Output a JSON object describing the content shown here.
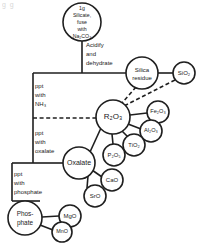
{
  "diagram": {
    "type": "flowchart",
    "artifact_text": "g  g",
    "colors": {
      "stroke": "#1f1f1f",
      "fill": "#ffffff",
      "background": "#ffffff"
    },
    "nodes": [
      {
        "id": "sample",
        "label_lines": [
          "1g",
          "Silicate,",
          "fuse",
          "with",
          "Na₂CO₃"
        ],
        "cx": 82,
        "cy": 22,
        "r": 19
      },
      {
        "id": "silica",
        "label_lines": [
          "Silica",
          "residue"
        ],
        "cx": 142,
        "cy": 73,
        "r": 16
      },
      {
        "id": "sio2",
        "label_lines": [
          "SiO₂"
        ],
        "cx": 184,
        "cy": 73,
        "r": 11
      },
      {
        "id": "r2o3",
        "label_lines": [
          "R₂O₃"
        ],
        "cx": 113,
        "cy": 117,
        "r": 17
      },
      {
        "id": "fe2o3",
        "label_lines": [
          "Fe₂O₃"
        ],
        "cx": 158,
        "cy": 112,
        "r": 11
      },
      {
        "id": "al2o3",
        "label_lines": [
          "Al₂O₃"
        ],
        "cx": 151,
        "cy": 131,
        "r": 11
      },
      {
        "id": "tio2",
        "label_lines": [
          "TiO₂"
        ],
        "cx": 134,
        "cy": 145,
        "r": 11
      },
      {
        "id": "p2o5",
        "label_lines": [
          "P₂O₅"
        ],
        "cx": 114,
        "cy": 155,
        "r": 11
      },
      {
        "id": "oxalate",
        "label_lines": [
          "Oxalate"
        ],
        "cx": 79,
        "cy": 163,
        "r": 16
      },
      {
        "id": "cao",
        "label_lines": [
          "CaO"
        ],
        "cx": 112,
        "cy": 180,
        "r": 11
      },
      {
        "id": "sro",
        "label_lines": [
          "SrO"
        ],
        "cx": 95,
        "cy": 196,
        "r": 11
      },
      {
        "id": "phosphate",
        "label_lines": [
          "Phos-",
          "phate"
        ],
        "cx": 25,
        "cy": 218,
        "r": 17
      },
      {
        "id": "mgo",
        "label_lines": [
          "MgO"
        ],
        "cx": 70,
        "cy": 216,
        "r": 11
      },
      {
        "id": "mno",
        "label_lines": [
          "MnO"
        ],
        "cx": 62,
        "cy": 232,
        "r": 10
      }
    ],
    "edge_labels": [
      {
        "id": "acidify",
        "lines": [
          "Acidify",
          "and",
          "dehydrate"
        ],
        "x": 86,
        "y": 44
      },
      {
        "id": "ppt-nh3",
        "lines": [
          "ppt",
          "with",
          "NH₃"
        ],
        "x": 35,
        "y": 86
      },
      {
        "id": "ppt-oxal",
        "lines": [
          "ppt",
          "with",
          "oxalate"
        ],
        "x": 35,
        "y": 133
      },
      {
        "id": "ppt-phos",
        "lines": [
          "ppt",
          "with",
          "phosphate"
        ],
        "x": 12,
        "y": 180
      }
    ],
    "connections": [
      {
        "from": "sample",
        "to": "silica",
        "style": "solid"
      },
      {
        "from": "silica",
        "to": "sio2",
        "style": "solid"
      },
      {
        "from": "silica",
        "to": "r2o3",
        "style": "dashed"
      },
      {
        "from": "sio2",
        "to": "r2o3",
        "style": "dashed"
      },
      {
        "from": "sample",
        "to": "r2o3",
        "style": "solid"
      },
      {
        "from": "r2o3",
        "to": "fe2o3",
        "style": "solid"
      },
      {
        "from": "r2o3",
        "to": "al2o3",
        "style": "solid"
      },
      {
        "from": "r2o3",
        "to": "tio2",
        "style": "solid"
      },
      {
        "from": "r2o3",
        "to": "p2o5",
        "style": "solid"
      },
      {
        "from": "r2o3",
        "to": "oxalate",
        "style": "solid"
      },
      {
        "from": "oxalate",
        "to": "cao",
        "style": "solid"
      },
      {
        "from": "oxalate",
        "to": "sro",
        "style": "solid"
      },
      {
        "from": "oxalate",
        "to": "phosphate",
        "style": "solid"
      },
      {
        "from": "phosphate",
        "to": "mgo",
        "style": "solid"
      },
      {
        "from": "phosphate",
        "to": "mno",
        "style": "solid"
      }
    ]
  }
}
